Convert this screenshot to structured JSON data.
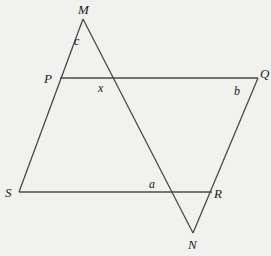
{
  "diagram": {
    "type": "geometry",
    "vertices": {
      "M": {
        "label": "M",
        "x": 83,
        "y": 19
      },
      "P": {
        "label": "P",
        "x": 60,
        "y": 78
      },
      "Q": {
        "label": "Q",
        "x": 258,
        "y": 78
      },
      "S": {
        "label": "S",
        "x": 19,
        "y": 192
      },
      "R": {
        "label": "R",
        "x": 212,
        "y": 192
      },
      "N": {
        "label": "N",
        "x": 193,
        "y": 233
      }
    },
    "angles": {
      "c": {
        "label": "c",
        "at": "M"
      },
      "x": {
        "label": "x",
        "at": "intersection of MN and PQ"
      },
      "b": {
        "label": "b",
        "at": "Q"
      },
      "a": {
        "label": "a",
        "at": "intersection of MN and SR"
      }
    },
    "segments": [
      {
        "from": "M",
        "to": "S",
        "name": "line-MS"
      },
      {
        "from": "M",
        "to": "N",
        "name": "line-MN"
      },
      {
        "from": "P",
        "to": "Q",
        "name": "line-PQ"
      },
      {
        "from": "S",
        "to": "R",
        "name": "line-SR"
      },
      {
        "from": "Q",
        "to": "N",
        "name": "line-QN"
      }
    ]
  }
}
